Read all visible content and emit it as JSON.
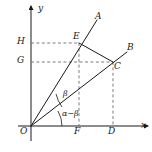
{
  "figure": {
    "kind": "geometry-diagram",
    "background_color": "#ffffff",
    "line_color": "#1a1a1a",
    "dashed_color": "#6e6e6e",
    "canvas": {
      "width": 152,
      "height": 152
    }
  },
  "axes": {
    "origin": {
      "x": 31,
      "y": 126
    },
    "x_axis": {
      "label": "x",
      "from_x": 18,
      "to_x": 148,
      "y": 126,
      "arrow": true
    },
    "y_axis": {
      "label": "y",
      "x": 31,
      "from_y": 140,
      "to_y": 5,
      "arrow": true
    }
  },
  "labels": {
    "origin": "O",
    "x_axis": "x",
    "y_axis": "y",
    "point_a": "A",
    "point_b": "B",
    "point_c": "C",
    "point_d": "D",
    "point_e": "E",
    "point_f": "F",
    "point_g": "G",
    "point_h": "H",
    "angle_beta": "β",
    "angle_alpha_minus_beta": "α−β"
  },
  "points": {
    "O": {
      "x": 31,
      "y": 126,
      "label": "O",
      "label_x": 21,
      "label_y": 128
    },
    "A": {
      "x": 97,
      "y": 20,
      "label": "A",
      "label_x": 96,
      "label_y": 13
    },
    "B": {
      "x": 127,
      "y": 52,
      "label": "B",
      "label_x": 127,
      "label_y": 44
    },
    "C": {
      "x": 113,
      "y": 62,
      "label": "C",
      "label_x": 115,
      "label_y": 63
    },
    "D": {
      "x": 113,
      "y": 126,
      "label": "D",
      "label_x": 109,
      "label_y": 128
    },
    "E": {
      "x": 79,
      "y": 43,
      "label": "E",
      "label_x": 74,
      "label_y": 33
    },
    "F": {
      "x": 79,
      "y": 126,
      "label": "F",
      "label_x": 75,
      "label_y": 128
    },
    "G": {
      "x": 31,
      "y": 62,
      "label": "G",
      "label_x": 17,
      "label_y": 57
    },
    "H": {
      "x": 31,
      "y": 43,
      "label": "H",
      "label_x": 17,
      "label_y": 38
    }
  },
  "solid_segments": [
    {
      "name": "ray-OA",
      "x1": 31,
      "y1": 126,
      "x2": 97,
      "y2": 20
    },
    {
      "name": "ray-OB",
      "x1": 31,
      "y1": 126,
      "x2": 127,
      "y2": 52
    },
    {
      "name": "segment-EC",
      "x1": 79,
      "y1": 43,
      "x2": 113,
      "y2": 62
    }
  ],
  "dashed_segments": [
    {
      "name": "dashed-H-to-E",
      "x1": 31,
      "y1": 43,
      "x2": 79,
      "y2": 43
    },
    {
      "name": "dashed-G-to-C",
      "x1": 31,
      "y1": 62,
      "x2": 113,
      "y2": 62
    },
    {
      "name": "dashed-E-to-F",
      "x1": 79,
      "y1": 43,
      "x2": 79,
      "y2": 126
    },
    {
      "name": "dashed-C-to-D",
      "x1": 113,
      "y1": 62,
      "x2": 113,
      "y2": 126
    }
  ],
  "angle_arcs": [
    {
      "name": "arc-beta",
      "label": "β",
      "path": "M 61 107 A 36 36 0 0 1 55 93",
      "label_x": 63,
      "label_y": 92
    },
    {
      "name": "arc-alpha-minus-beta",
      "label": "α−β",
      "path": "M 61 126 A 30 30 0 0 0 57 110",
      "label_x": 63,
      "label_y": 112
    }
  ]
}
